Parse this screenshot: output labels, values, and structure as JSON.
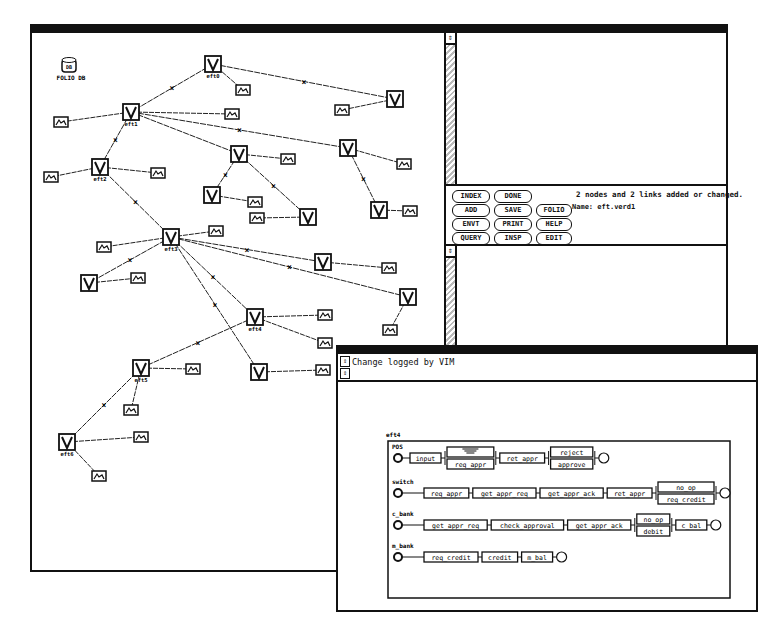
{
  "graph_window": {
    "db_icon": {
      "label": "FOLIO DB",
      "glyph": "DB"
    },
    "nodes": [
      {
        "id": "eft0",
        "label": "eft0",
        "x": 213,
        "y": 62,
        "kind": "version"
      },
      {
        "id": "eft1",
        "label": "eft1",
        "x": 131,
        "y": 110,
        "kind": "version"
      },
      {
        "id": "eft2",
        "label": "eft2",
        "x": 100,
        "y": 165,
        "kind": "version"
      },
      {
        "id": "eft3",
        "label": "eft3",
        "x": 171,
        "y": 235,
        "kind": "version"
      },
      {
        "id": "eft4",
        "label": "eft4",
        "x": 255,
        "y": 315,
        "kind": "version"
      },
      {
        "id": "eft5",
        "label": "eft5",
        "x": 141,
        "y": 366,
        "kind": "version"
      },
      {
        "id": "eft6",
        "label": "eft6",
        "x": 67,
        "y": 440,
        "kind": "version"
      },
      {
        "id": "n_a",
        "label": "",
        "x": 395,
        "y": 97,
        "kind": "version"
      },
      {
        "id": "n_b",
        "label": "",
        "x": 239,
        "y": 152,
        "kind": "version"
      },
      {
        "id": "n_c",
        "label": "",
        "x": 348,
        "y": 146,
        "kind": "version"
      },
      {
        "id": "n_d",
        "label": "",
        "x": 212,
        "y": 193,
        "kind": "version"
      },
      {
        "id": "n_e",
        "label": "",
        "x": 308,
        "y": 215,
        "kind": "version"
      },
      {
        "id": "n_f",
        "label": "",
        "x": 379,
        "y": 208,
        "kind": "version"
      },
      {
        "id": "n_g",
        "label": "",
        "x": 89,
        "y": 281,
        "kind": "version"
      },
      {
        "id": "n_h",
        "label": "",
        "x": 323,
        "y": 260,
        "kind": "version"
      },
      {
        "id": "n_i",
        "label": "",
        "x": 408,
        "y": 295,
        "kind": "version"
      },
      {
        "id": "n_j",
        "label": "",
        "x": 259,
        "y": 370,
        "kind": "version"
      }
    ],
    "edges": [
      [
        "eft0",
        "eft1",
        true
      ],
      [
        "eft0",
        "n_a",
        true
      ],
      [
        "eft1",
        "eft2",
        true
      ],
      [
        "eft1",
        "n_b",
        false
      ],
      [
        "eft1",
        "n_c",
        true
      ],
      [
        "eft2",
        "eft3",
        true
      ],
      [
        "n_b",
        "n_d",
        true
      ],
      [
        "n_b",
        "n_e",
        true
      ],
      [
        "n_c",
        "n_f",
        true
      ],
      [
        "eft3",
        "n_g",
        true
      ],
      [
        "eft3",
        "n_h",
        true
      ],
      [
        "eft3",
        "n_i",
        true
      ],
      [
        "eft3",
        "eft4",
        true
      ],
      [
        "eft3",
        "n_j",
        true
      ],
      [
        "eft4",
        "eft5",
        true
      ],
      [
        "eft5",
        "eft6",
        true
      ]
    ],
    "objects": [
      {
        "x": 243,
        "y": 88,
        "from": "eft0"
      },
      {
        "x": 342,
        "y": 108,
        "from": "n_a"
      },
      {
        "x": 61,
        "y": 120,
        "from": "eft1"
      },
      {
        "x": 232,
        "y": 112,
        "from": "eft1"
      },
      {
        "x": 51,
        "y": 175,
        "from": "eft2"
      },
      {
        "x": 158,
        "y": 171,
        "from": "eft2"
      },
      {
        "x": 288,
        "y": 157,
        "from": "n_b"
      },
      {
        "x": 255,
        "y": 200,
        "from": "n_d"
      },
      {
        "x": 257,
        "y": 216,
        "from": "n_e"
      },
      {
        "x": 404,
        "y": 162,
        "from": "n_c"
      },
      {
        "x": 410,
        "y": 209,
        "from": "n_f"
      },
      {
        "x": 216,
        "y": 229,
        "from": "eft3"
      },
      {
        "x": 104,
        "y": 245,
        "from": "eft3"
      },
      {
        "x": 138,
        "y": 276,
        "from": "n_g"
      },
      {
        "x": 389,
        "y": 266,
        "from": "n_h"
      },
      {
        "x": 390,
        "y": 328,
        "from": "n_i"
      },
      {
        "x": 325,
        "y": 313,
        "from": "eft4"
      },
      {
        "x": 325,
        "y": 341,
        "from": "eft4"
      },
      {
        "x": 193,
        "y": 367,
        "from": "eft5"
      },
      {
        "x": 131,
        "y": 408,
        "from": "eft5"
      },
      {
        "x": 141,
        "y": 435,
        "from": "eft6"
      },
      {
        "x": 99,
        "y": 474,
        "from": "eft6"
      },
      {
        "x": 323,
        "y": 368,
        "from": "n_j"
      }
    ]
  },
  "control_panel": {
    "buttons": [
      [
        "INDEX",
        "DONE"
      ],
      [
        "ADD",
        "SAVE",
        "FOLIO"
      ],
      [
        "ENVT",
        "PRINT",
        "HELP"
      ],
      [
        "QUERY",
        "INSP",
        "EDIT"
      ]
    ],
    "status_message": "2 nodes and 2 links added or changed.",
    "name_line": "Name: eft.verd1"
  },
  "log_window": {
    "message": "Change logged by VIM"
  },
  "process_diagram": {
    "title": "eft4",
    "lanes": [
      {
        "name": "POS",
        "steps": [
          {
            "alts": [
              "",
              "req_appr"
            ],
            "first": "input"
          },
          "ret_appr",
          {
            "alts": [
              "reject",
              "approve"
            ]
          }
        ]
      },
      {
        "name": "switch",
        "steps": [
          "req_appr",
          "get_appr_req",
          "get_appr_ack",
          "ret_appr",
          {
            "alts": [
              "no_op",
              "req_credit"
            ]
          }
        ]
      },
      {
        "name": "c_bank",
        "steps": [
          "get_appr_req",
          "check_approval",
          "get_appr_ack",
          {
            "alts": [
              "no_op",
              "debit"
            ]
          },
          "c_bal"
        ]
      },
      {
        "name": "m_bank",
        "steps": [
          "req_credit",
          "credit",
          "m_bal"
        ]
      }
    ]
  }
}
